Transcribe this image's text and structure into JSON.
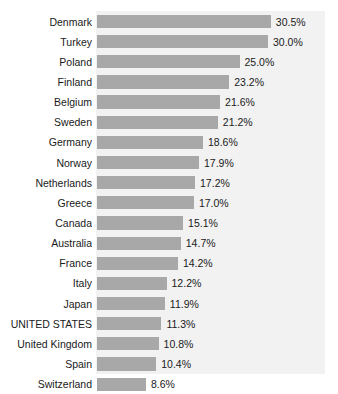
{
  "chart_data": {
    "type": "bar",
    "orientation": "horizontal",
    "title": "",
    "subtitle": "",
    "xlabel": "",
    "ylabel": "",
    "xlim": [
      0,
      32
    ],
    "grid": false,
    "legend": null,
    "value_suffix": "%",
    "categories": [
      "Denmark",
      "Turkey",
      "Poland",
      "Finland",
      "Belgium",
      "Sweden",
      "Germany",
      "Norway",
      "Netherlands",
      "Greece",
      "Canada",
      "Australia",
      "France",
      "Italy",
      "Japan",
      "UNITED STATES",
      "United Kingdom",
      "Spain",
      "Switzerland"
    ],
    "values": [
      30.5,
      30.0,
      25.0,
      23.2,
      21.6,
      21.2,
      18.6,
      17.9,
      17.2,
      17.0,
      15.1,
      14.7,
      14.2,
      12.2,
      11.9,
      11.3,
      10.8,
      10.4,
      8.6
    ],
    "data_labels": [
      "30.5%",
      "30.0%",
      "25.0%",
      "23.2%",
      "21.6%",
      "21.2%",
      "18.6%",
      "17.9%",
      "17.2%",
      "17.0%",
      "15.1%",
      "14.7%",
      "14.2%",
      "12.2%",
      "11.9%",
      "11.3%",
      "10.8%",
      "10.4%",
      "8.6%"
    ],
    "colors": {
      "bar": "#a8a8a8",
      "plot_background": "#f2f2f2",
      "page_background": "#ffffff",
      "text": "#1a1a1a"
    }
  }
}
